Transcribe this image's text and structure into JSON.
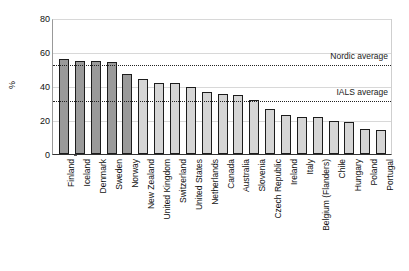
{
  "chart_data": {
    "type": "bar",
    "title": "",
    "xlabel": "",
    "ylabel": "%",
    "ylim": [
      0,
      80
    ],
    "yticks": [
      0,
      20,
      40,
      60,
      80
    ],
    "grid": true,
    "legend": "none",
    "categories": [
      "Finland",
      "Iceland",
      "Denmark",
      "Sweden",
      "Norway",
      "New Zealand",
      "United Kingdom",
      "Switzerland",
      "United States",
      "Netherlands",
      "Canada",
      "Australia",
      "Slovenia",
      "Czech Republic",
      "Ireland",
      "Italy",
      "Belgium (Flanders)",
      "Chile",
      "Hungary",
      "Poland",
      "Portugal"
    ],
    "values": [
      56,
      55,
      55,
      54,
      47,
      44,
      42,
      41.5,
      39.5,
      36.5,
      35.5,
      35,
      32,
      26.5,
      23,
      22,
      22,
      19.5,
      19,
      15,
      14
    ],
    "bar_styles": [
      "dark",
      "dark",
      "dark",
      "dark",
      "dark",
      "light",
      "light",
      "light",
      "light",
      "light",
      "light",
      "light",
      "light",
      "light",
      "light",
      "light",
      "light",
      "light",
      "light",
      "light",
      "light"
    ],
    "annotations": [
      {
        "label": "Nordic average",
        "value": 53
      },
      {
        "label": "IALS average",
        "value": 31.5
      }
    ],
    "colors": {
      "bar_dark": "#9a9a9a",
      "bar_light": "#d5d5d5",
      "bar_border": "#1c1c1c",
      "gridline": "#d8d8d8",
      "refline": "#222222",
      "axis": "#333333",
      "text": "#111111"
    }
  }
}
